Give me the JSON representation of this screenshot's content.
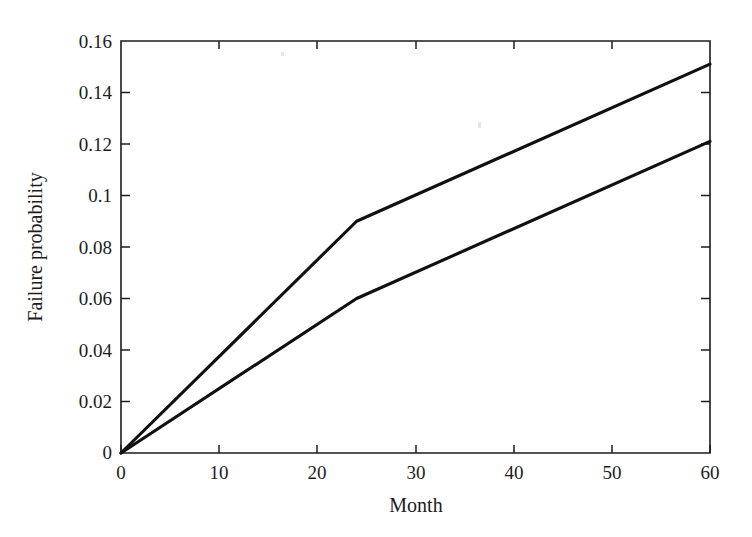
{
  "chart_data": {
    "type": "line",
    "title": "",
    "subtitle": "",
    "xlabel": "Month",
    "ylabel": "Failure probability",
    "xlim": [
      0,
      60
    ],
    "ylim": [
      0,
      0.16
    ],
    "xticks": [
      0,
      10,
      20,
      30,
      40,
      50,
      60
    ],
    "xtick_labels": [
      "0",
      "10",
      "20",
      "30",
      "40",
      "50",
      "60"
    ],
    "yticks": [
      0,
      0.02,
      0.04,
      0.06,
      0.08,
      0.1,
      0.12,
      0.14,
      0.16
    ],
    "ytick_labels": [
      "0",
      "0.02",
      "0.04",
      "0.06",
      "0.08",
      "0.1",
      "0.12",
      "0.14",
      "0.16"
    ],
    "grid": false,
    "legend": null,
    "legend_position": "none",
    "line_color": "#101010",
    "background_color": "#ffffff",
    "series": [
      {
        "name": "upper-curve",
        "x": [
          0,
          24,
          60
        ],
        "values": [
          0,
          0.09,
          0.151
        ]
      },
      {
        "name": "lower-curve",
        "x": [
          0,
          24,
          60
        ],
        "values": [
          0,
          0.06,
          0.121
        ]
      }
    ],
    "annotations": []
  },
  "figure": {
    "caption": ""
  }
}
